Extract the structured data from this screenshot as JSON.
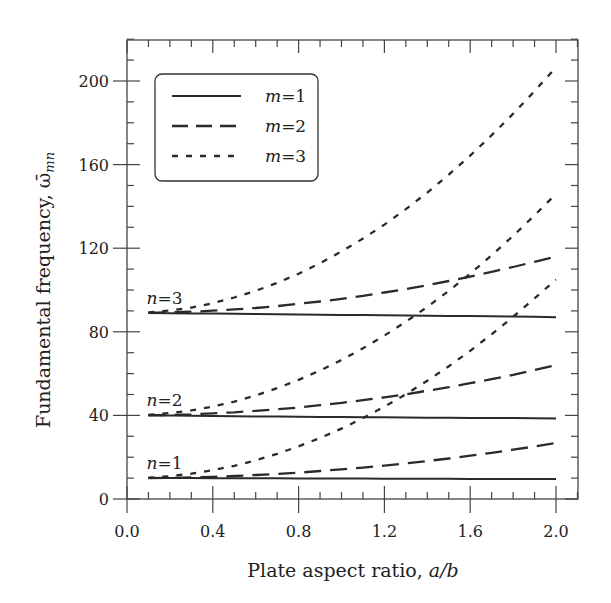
{
  "chart_data": {
    "type": "line",
    "title": "",
    "xlabel": "Plate aspect ratio, a/b",
    "xlabel_parts": {
      "text": "Plate aspect ratio, ",
      "italic": "a/b"
    },
    "ylabel": "Fundamental frequency, ω̄mn",
    "ylabel_parts": {
      "text": "Fundamental frequency, ",
      "symbol": "ω̄",
      "subscript": "mn"
    },
    "xlim": [
      0.0,
      2.1
    ],
    "ylim": [
      0,
      220
    ],
    "xticks": [
      0.0,
      0.4,
      0.8,
      1.2,
      1.6,
      2.0
    ],
    "xtick_labels": [
      "0.0",
      "0.4",
      "0.8",
      "1.2",
      "1.6",
      "2.0"
    ],
    "yticks": [
      0,
      40,
      80,
      120,
      160,
      200
    ],
    "ytick_labels": [
      "0",
      "40",
      "80",
      "120",
      "160",
      "200"
    ],
    "grid": false,
    "legend_position": "upper left",
    "legend": [
      {
        "label": "m=1",
        "var": "m",
        "value": "1",
        "style": "solid"
      },
      {
        "label": "m=2",
        "var": "m",
        "value": "2",
        "style": "long-dash"
      },
      {
        "label": "m=3",
        "var": "m",
        "value": "3",
        "style": "short-dash"
      }
    ],
    "annotations": [
      {
        "text": "n=1",
        "var": "n",
        "value": "1",
        "x": 0.1,
        "y": 10
      },
      {
        "text": "n=2",
        "var": "n",
        "value": "2",
        "x": 0.1,
        "y": 40
      },
      {
        "text": "n=3",
        "var": "n",
        "value": "3",
        "x": 0.1,
        "y": 89
      }
    ],
    "x": [
      0.1,
      0.2,
      0.3,
      0.4,
      0.5,
      0.6,
      0.7,
      0.8,
      0.9,
      1.0,
      1.1,
      1.2,
      1.3,
      1.4,
      1.5,
      1.6,
      1.7,
      1.8,
      1.9,
      2.0
    ],
    "series": [
      {
        "name": "n=1, m=1",
        "n": 1,
        "m": 1,
        "style": "solid",
        "values": [
          10.0,
          10.0,
          10.0,
          9.9,
          9.9,
          9.9,
          9.9,
          9.8,
          9.8,
          9.8,
          9.8,
          9.7,
          9.7,
          9.7,
          9.7,
          9.6,
          9.6,
          9.6,
          9.6,
          9.5
        ]
      },
      {
        "name": "n=1, m=2",
        "n": 1,
        "m": 2,
        "style": "long-dash",
        "values": [
          10.0,
          10.1,
          10.3,
          10.6,
          11.0,
          11.5,
          12.0,
          12.6,
          13.4,
          14.2,
          15.0,
          16.0,
          17.1,
          18.2,
          19.4,
          20.7,
          22.1,
          23.6,
          25.1,
          26.8
        ]
      },
      {
        "name": "n=1, m=3",
        "n": 1,
        "m": 3,
        "style": "short-dash",
        "values": [
          10.2,
          10.9,
          12.1,
          13.8,
          15.9,
          18.5,
          21.6,
          25.2,
          29.2,
          33.7,
          38.7,
          44.2,
          50.1,
          56.6,
          63.5,
          70.9,
          78.8,
          87.2,
          96.0,
          105.0
        ]
      },
      {
        "name": "n=2, m=1",
        "n": 2,
        "m": 1,
        "style": "solid",
        "values": [
          40.0,
          39.9,
          39.8,
          39.7,
          39.6,
          39.5,
          39.5,
          39.4,
          39.3,
          39.2,
          39.1,
          39.1,
          39.0,
          38.9,
          38.9,
          38.8,
          38.7,
          38.7,
          38.6,
          38.5
        ]
      },
      {
        "name": "n=2, m=2",
        "n": 2,
        "m": 2,
        "style": "long-dash",
        "values": [
          40.1,
          40.2,
          40.5,
          41.0,
          41.5,
          42.2,
          42.9,
          43.8,
          44.9,
          46.0,
          47.3,
          48.6,
          50.1,
          51.8,
          53.5,
          55.4,
          57.3,
          59.4,
          61.7,
          64.0
        ]
      },
      {
        "name": "n=2, m=3",
        "n": 2,
        "m": 3,
        "style": "short-dash",
        "values": [
          40.3,
          41.1,
          42.4,
          44.2,
          46.6,
          49.5,
          53.0,
          57.0,
          61.5,
          66.5,
          72.1,
          78.2,
          84.8,
          91.9,
          99.6,
          107.8,
          116.6,
          125.9,
          135.7,
          146.0
        ]
      },
      {
        "name": "n=3, m=1",
        "n": 3,
        "m": 1,
        "style": "solid",
        "values": [
          89.0,
          88.9,
          88.8,
          88.7,
          88.6,
          88.5,
          88.4,
          88.3,
          88.2,
          88.1,
          88.0,
          87.9,
          87.8,
          87.7,
          87.6,
          87.5,
          87.4,
          87.3,
          87.2,
          87.0
        ]
      },
      {
        "name": "n=3, m=2",
        "n": 3,
        "m": 2,
        "style": "long-dash",
        "values": [
          89.1,
          89.3,
          89.6,
          90.1,
          90.7,
          91.4,
          92.3,
          93.4,
          94.5,
          95.8,
          97.2,
          98.8,
          100.5,
          102.3,
          104.3,
          106.4,
          108.7,
          111.0,
          113.5,
          116.0
        ]
      },
      {
        "name": "n=3, m=3",
        "n": 3,
        "m": 3,
        "style": "short-dash",
        "values": [
          89.3,
          90.2,
          91.6,
          93.7,
          96.4,
          99.6,
          103.4,
          107.8,
          112.8,
          118.4,
          124.6,
          131.3,
          138.7,
          146.6,
          155.2,
          164.3,
          174.0,
          184.3,
          195.1,
          206.6
        ]
      }
    ]
  }
}
